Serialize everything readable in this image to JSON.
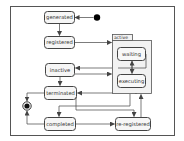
{
  "diagram": {
    "type": "UML state machine",
    "colors": {
      "frame": "#555555",
      "state_fill": "#f6f6f6",
      "state_border": "#444444",
      "arrow": "#444444",
      "initial": "#000000",
      "composite_fill": "#f2f2f2"
    },
    "states": {
      "generated": "generated",
      "registered": "registered",
      "inactive": "inactive",
      "terminated": "terminated",
      "completed": "completed",
      "re_registered": "re-registered",
      "active": "active",
      "waiting": "waiting",
      "executing": "executing"
    },
    "pseudostates": {
      "initial": "initial-state",
      "final": "final-state"
    },
    "transitions": [
      {
        "from": "initial",
        "to": "generated"
      },
      {
        "from": "generated",
        "to": "registered"
      },
      {
        "from": "registered",
        "to": "active"
      },
      {
        "from": "active",
        "to": "inactive"
      },
      {
        "from": "inactive",
        "to": "active"
      },
      {
        "from": "inactive",
        "to": "terminated"
      },
      {
        "from": "active",
        "to": "terminated"
      },
      {
        "from": "waiting",
        "to": "executing"
      },
      {
        "from": "executing",
        "to": "waiting"
      },
      {
        "from": "terminated",
        "to": "final"
      },
      {
        "from": "completed",
        "to": "final"
      },
      {
        "from": "active",
        "to": "completed"
      },
      {
        "from": "terminated",
        "to": "re-registered"
      },
      {
        "from": "completed",
        "to": "re-registered"
      },
      {
        "from": "re-registered",
        "to": "active"
      }
    ]
  }
}
